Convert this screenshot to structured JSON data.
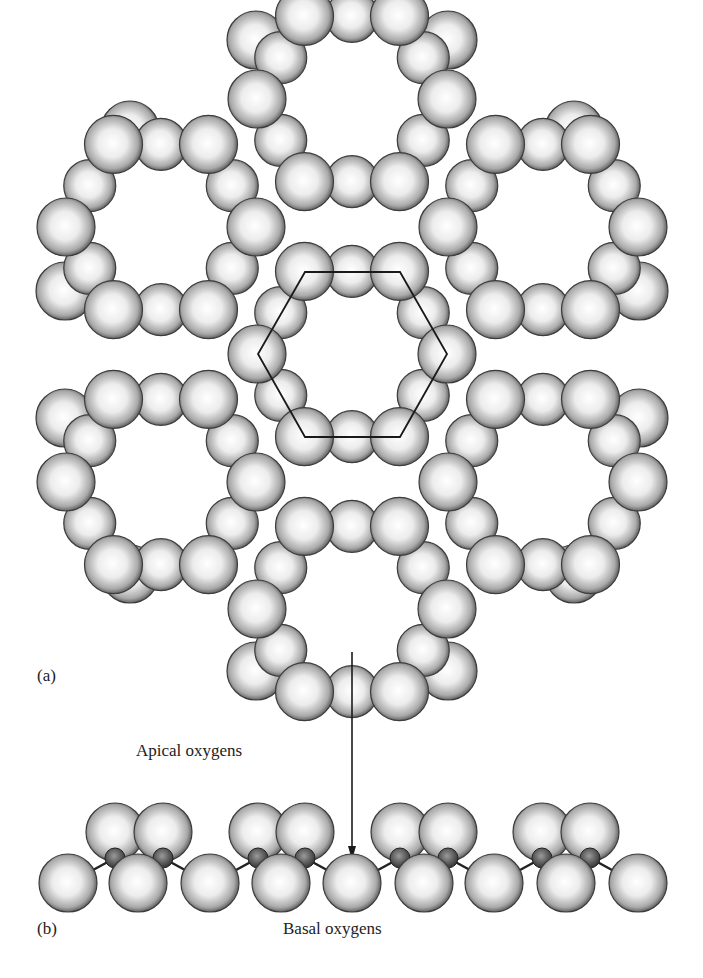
{
  "figure": {
    "panel_a_label": "(a)",
    "panel_b_label": "(b)",
    "apical_label": "Apical oxygens",
    "basal_label": "Basal oxygens"
  },
  "colors": {
    "sphere_highlight": "#ffffff",
    "sphere_mid": "#d4d4d4",
    "sphere_edge": "#4a4a4a",
    "cation_fill": "#555555",
    "line": "#1a1a1a"
  },
  "top_view": {
    "sphere_radius": 29,
    "ring_centers": [
      [
        352,
        99
      ],
      [
        161,
        227
      ],
      [
        543,
        227
      ],
      [
        352,
        354
      ],
      [
        161,
        482
      ],
      [
        543,
        482
      ],
      [
        352,
        609
      ]
    ],
    "ring_radius": 95,
    "unit_cell_hexagon": [
      [
        305,
        272
      ],
      [
        400,
        272
      ],
      [
        447,
        354
      ],
      [
        400,
        437
      ],
      [
        305,
        437
      ],
      [
        258,
        354
      ]
    ],
    "outer_tips": [
      [
        256,
        40
      ],
      [
        448,
        40
      ],
      [
        130,
        130
      ],
      [
        574,
        130
      ],
      [
        65,
        291
      ],
      [
        639,
        291
      ],
      [
        65,
        418
      ],
      [
        639,
        418
      ],
      [
        130,
        574
      ],
      [
        574,
        574
      ],
      [
        256,
        671
      ],
      [
        448,
        671
      ]
    ]
  },
  "arrow": {
    "x": 352,
    "y1": 652,
    "y2": 860
  },
  "side_view": {
    "basal_radius": 29,
    "apical_radius": 29,
    "cation_radius": 10,
    "basal_y": 883,
    "basal_x": [
      68,
      138,
      210,
      281,
      352,
      424,
      494,
      566,
      638
    ],
    "apical_y": 832,
    "apical_pairs": [
      [
        115,
        163
      ],
      [
        258,
        305
      ],
      [
        400,
        448
      ],
      [
        542,
        590
      ]
    ],
    "cation_y": 858,
    "cation_x": [
      115,
      163,
      258,
      305,
      400,
      448,
      542,
      590
    ]
  }
}
